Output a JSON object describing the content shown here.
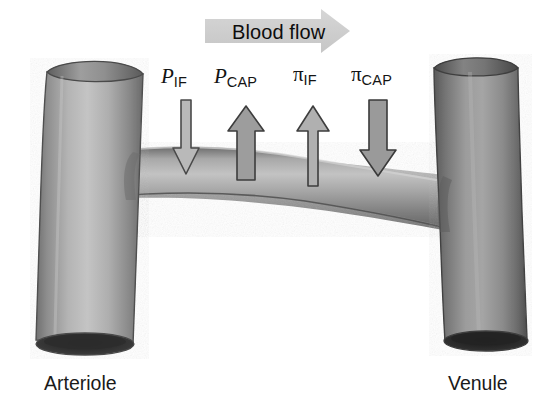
{
  "figure": {
    "background_color": "#ffffff"
  },
  "flow": {
    "label": "Blood flow",
    "direction": "right",
    "arrow_color": "#cfcfcf",
    "icon": "block-arrow-right-icon"
  },
  "forces": [
    {
      "id": "p-if",
      "symbol": "P",
      "subscript": "IF",
      "name": "interstitial-fluid-hydrostatic-pressure",
      "direction": "down",
      "shaft_width": 9,
      "head_width": 27,
      "color": "#b9b9b9",
      "outline": "#4a4a4a",
      "x": 186,
      "top": 100,
      "bottom": 174
    },
    {
      "id": "p-cap",
      "symbol": "P",
      "subscript": "CAP",
      "name": "capillary-hydrostatic-pressure",
      "direction": "up",
      "shaft_width": 17,
      "head_width": 36,
      "color": "#9d9d9d",
      "outline": "#3d3d3d",
      "x": 246,
      "top": 106,
      "bottom": 180
    },
    {
      "id": "pi-if",
      "symbol": "π",
      "subscript": "IF",
      "name": "interstitial-fluid-oncotic-pressure",
      "direction": "up",
      "shaft_width": 10,
      "head_width": 32,
      "color": "#b0b0b0",
      "outline": "#3d3d3d",
      "x": 313,
      "top": 106,
      "bottom": 186
    },
    {
      "id": "pi-cap",
      "symbol": "π",
      "subscript": "CAP",
      "name": "capillary-oncotic-pressure",
      "direction": "down",
      "shaft_width": 17,
      "head_width": 36,
      "color": "#9a9a9a",
      "outline": "#3a3a3a",
      "x": 378,
      "top": 100,
      "bottom": 176
    }
  ],
  "force_label_positions": [
    {
      "left": 161,
      "top": 66
    },
    {
      "left": 214,
      "top": 66
    },
    {
      "left": 293,
      "top": 64
    },
    {
      "left": 351,
      "top": 64
    }
  ],
  "vessels": {
    "arteriole": {
      "label": "Arteriole",
      "color_light": "#c2c2c2",
      "color_mid": "#9a9a9a",
      "color_dark": "#6e6e6e",
      "lumen_color": "#2f2f2f"
    },
    "venule": {
      "label": "Venule",
      "color_light": "#a9a9a9",
      "color_mid": "#7e7e7e",
      "color_dark": "#555555",
      "lumen_color": "#262626"
    },
    "capillary": {
      "name": "capillary-arch",
      "color_light": "#bdbdbd",
      "color_mid": "#8f8f8f",
      "color_dark": "#5f5f5f"
    }
  }
}
